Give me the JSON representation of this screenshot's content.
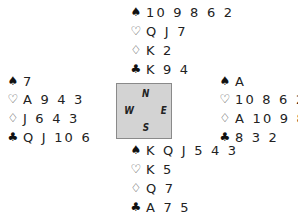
{
  "north": {
    "spades": "10 9 8 6 2",
    "hearts": "Q J 7",
    "diamonds": "K 2",
    "clubs": "K 9 4"
  },
  "west": {
    "spades": "7",
    "hearts": "A 9 4 3",
    "diamonds": "J 6 4 3",
    "clubs": "Q J 10 6"
  },
  "east": {
    "spades": "A",
    "hearts": "10 8 6 2",
    "diamonds": "A 10 9 8 5",
    "clubs": "8 3 2"
  },
  "south": {
    "spades": "K Q J 5 4 3",
    "hearts": "K 5",
    "diamonds": "Q 7",
    "clubs": "A 7 5"
  },
  "compass": {
    "north": "N",
    "south": "S",
    "west": "W",
    "east": "E",
    "background": "#d3d3d3"
  },
  "suits": {
    "spades": "♠",
    "hearts": "♡",
    "diamonds": "♢",
    "clubs": "♣"
  }
}
